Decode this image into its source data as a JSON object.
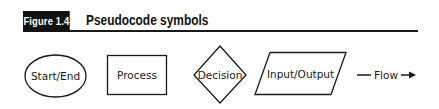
{
  "figure": {
    "label": "Figure 1.4",
    "title": "Pseudocode symbols"
  },
  "symbols": [
    {
      "name": "start-end",
      "shape": "ellipse",
      "label": "Start/End"
    },
    {
      "name": "process",
      "shape": "rectangle",
      "label": "Process"
    },
    {
      "name": "decision",
      "shape": "diamond",
      "label": "Decision"
    },
    {
      "name": "input-output",
      "shape": "parallelogram",
      "label": "Input/Output"
    },
    {
      "name": "flow",
      "shape": "arrow",
      "label": "Flow"
    }
  ],
  "colors": {
    "stroke": "#1a1a1a",
    "label_bg": "#111111",
    "label_fg": "#ffffff",
    "background": "#ffffff"
  }
}
